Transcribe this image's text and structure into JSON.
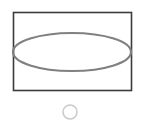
{
  "canvas": {
    "width": 143,
    "height": 124,
    "background_color": "#ffffff",
    "title": "Ellipse inscribed in rectangle with small circle below"
  },
  "colors": {
    "rectangle_stroke": "#3b3b3b",
    "ellipse_stroke": "#808080",
    "circle_stroke": "#c9c9c9",
    "fill": "none",
    "background": "#ffffff"
  },
  "shapes": {
    "rectangle": {
      "name": "bounding-rectangle",
      "x": 13.5,
      "y": 12.5,
      "width": 118,
      "height": 78,
      "stroke_width": 1.6,
      "fill": "none"
    },
    "ellipse": {
      "name": "inscribed-ellipse",
      "cx": 72,
      "cy": 52,
      "rx": 59,
      "ry": 19,
      "stroke_width": 2.2,
      "fill": "none"
    },
    "circle": {
      "name": "small-circle",
      "cx": 70,
      "cy": 112,
      "r": 7,
      "stroke_width": 1.5,
      "fill": "none"
    }
  }
}
